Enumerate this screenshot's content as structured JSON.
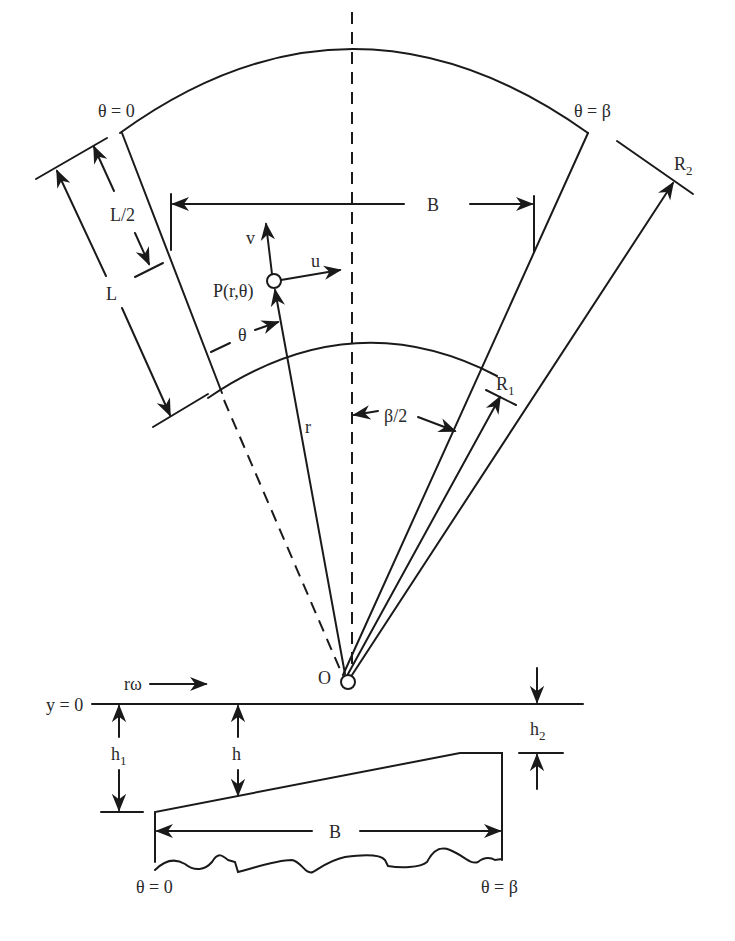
{
  "figure": {
    "type": "sector thrust pad geometry diagram",
    "colors": {
      "ink": "#1a1a1a",
      "background": "#ffffff"
    }
  },
  "plan_view": {
    "labels": {
      "theta_zero": "θ = 0",
      "theta_beta": "θ = β",
      "outer_radius": "R",
      "outer_radius_sub": "2",
      "inner_radius": "R",
      "inner_radius_sub": "1",
      "width": "B",
      "length": "L",
      "half_length": "L/2",
      "point": "P(r,θ)",
      "velocity_u": "u",
      "velocity_v": "v",
      "angle_theta": "θ",
      "radius_r": "r",
      "half_angle": "β/2",
      "origin": "O"
    }
  },
  "section_view": {
    "labels": {
      "surface_velocity": "rω",
      "datum": "y = 0",
      "inlet_film": "h",
      "inlet_film_sub": "1",
      "local_film": "h",
      "outlet_film": "h",
      "outlet_film_sub": "2",
      "width": "B",
      "theta_zero": "θ = 0",
      "theta_beta": "θ = β"
    }
  }
}
